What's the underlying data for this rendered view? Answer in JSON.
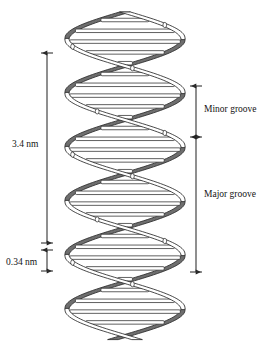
{
  "figure": {
    "width": 269,
    "height": 350,
    "background_color": "#ffffff"
  },
  "labels": {
    "pitch": "3.4 nm",
    "rise": "0.34 nm",
    "minor_groove": "Minor groove",
    "major_groove": "Major groove"
  },
  "icons": {
    "pitch_dimension": "double-arrow-vertical-icon",
    "rise_dimension": "double-arrow-vertical-icon",
    "minor_groove_dimension": "double-arrow-vertical-icon",
    "major_groove_dimension": "double-arrow-vertical-icon"
  },
  "colors": {
    "ink": "#141414",
    "strand_back_fill": "#6e6e6e",
    "strand_front_fill": "#ffffff",
    "basepair_fill": "#ffffff",
    "outline": "#2b2b2b",
    "dimension_line": "#333333"
  },
  "chart_data": {
    "type": "diagram",
    "annotations": [
      {
        "name": "pitch",
        "label": "3.4 nm",
        "side": "left",
        "y_top": 53,
        "y_bottom": 243,
        "meaning": "helical pitch / one complete turn"
      },
      {
        "name": "rise",
        "label": "0.34 nm",
        "side": "left",
        "y_top": 250,
        "y_bottom": 271,
        "meaning": "rise per base pair"
      },
      {
        "name": "minor_groove",
        "label": "Minor groove",
        "side": "right",
        "y_top": 86,
        "y_bottom": 137,
        "meaning": "narrow groove width"
      },
      {
        "name": "major_groove",
        "label": "Major groove",
        "side": "right",
        "y_top": 137,
        "y_bottom": 272,
        "meaning": "wide groove width"
      }
    ],
    "helix": {
      "turns": 3,
      "center_x": 125,
      "radius_x": 58,
      "y_start": 12,
      "y_end": 340,
      "pitch_px": 108,
      "basepair_count": 30,
      "basepair_spacing_px": 10.8,
      "strands": 2,
      "strand_phase_offset_deg": 180
    }
  }
}
